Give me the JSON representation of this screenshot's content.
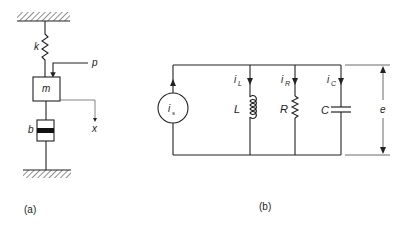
{
  "figure_a": {
    "caption": "(a)",
    "labels": {
      "spring": "k",
      "mass": "m",
      "force": "p",
      "damper": "b",
      "displacement": "x"
    }
  },
  "figure_b": {
    "caption": "(b)",
    "labels": {
      "source": "i",
      "source_sub": "s",
      "inductor_current": "i",
      "inductor_current_sub": "L",
      "inductor": "L",
      "resistor_current": "i",
      "resistor_current_sub": "R",
      "resistor": "R",
      "capacitor_current": "i",
      "capacitor_current_sub": "C",
      "capacitor": "C",
      "voltage": "e"
    }
  },
  "colors": {
    "ink": "#222222",
    "background": "#ffffff"
  }
}
